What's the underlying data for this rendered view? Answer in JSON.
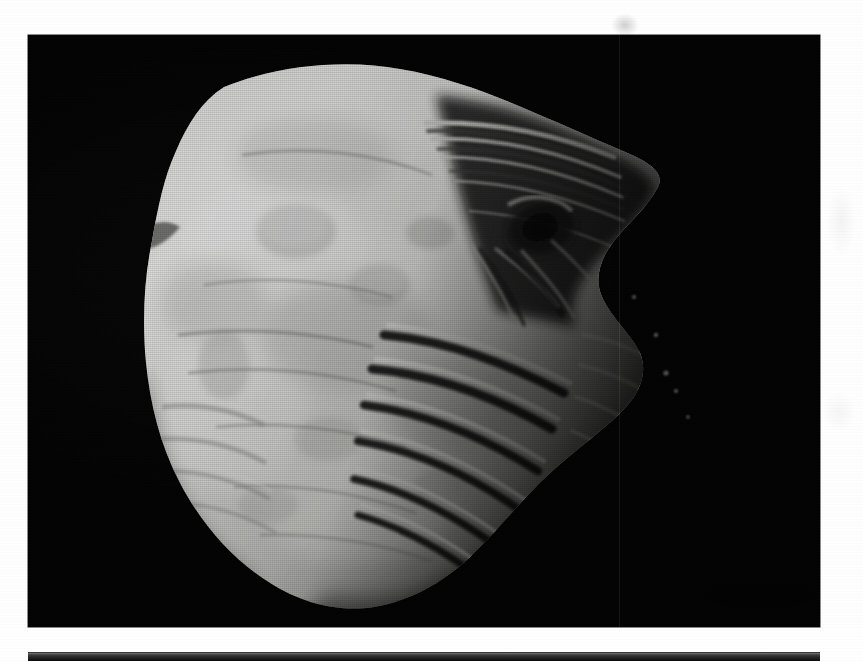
{
  "page": {
    "kind": "scanned-photographic-plate",
    "width": 863,
    "height": 661,
    "background_color": "#ffffff",
    "caption": "",
    "page_number": ""
  },
  "plates": [
    {
      "id": "plate-one",
      "name": "asteroid-photograph",
      "subject": "irregular small body (asteroid / small moon) lit from the left",
      "frame": {
        "x": 28,
        "y": 35,
        "width": 792,
        "height": 592
      },
      "background_color": "#040404",
      "body": {
        "limb_color": "#e6e6e4",
        "terminator_color": "#6d6d6b",
        "shadow_color": "#0a0a0a",
        "illumination": "left",
        "surface_features": [
          "large dark crater near upper-right terminator",
          "parallel grooves / striations across the lower-right terminator",
          "shallow subdued craters on the sunlit face",
          "ridged scarp along the lower-left limb"
        ]
      },
      "artifacts": {
        "vertical_scan_line_x": 619,
        "halftone": "fine raster dither from print scan"
      }
    },
    {
      "id": "plate-two",
      "name": "next-figure-top-edge",
      "frame": {
        "x": 28,
        "y": 652,
        "width": 792,
        "height": 9
      },
      "background_color": "#0a0a0a"
    }
  ],
  "colors": {
    "paper": "#ffffff",
    "plate_black": "#040404",
    "highlight": "#f2f2f0",
    "midtone": "#9a9a98",
    "shadow": "#141414"
  }
}
